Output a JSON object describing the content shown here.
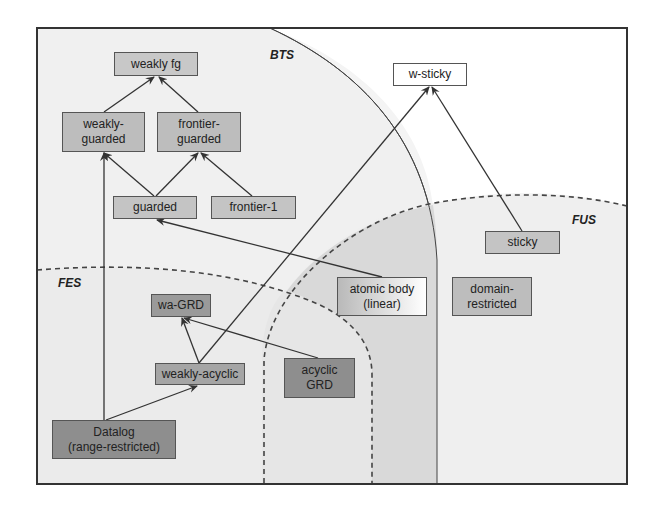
{
  "regions": {
    "bts": {
      "label": "BTS"
    },
    "fus": {
      "label": "FUS"
    },
    "fes": {
      "label": "FES"
    }
  },
  "nodes": [
    {
      "id": "weakly-fg",
      "label": "weakly fg",
      "x": 114,
      "y": 52,
      "w": 84,
      "h": 24,
      "fill": "#c8c8c8"
    },
    {
      "id": "weakly-guarded",
      "label": "weakly-\nguarded",
      "x": 62,
      "y": 112,
      "w": 83,
      "h": 40,
      "fill": "#bdbdbd"
    },
    {
      "id": "frontier-guarded",
      "label": "frontier-\nguarded",
      "x": 157,
      "y": 112,
      "w": 84,
      "h": 40,
      "fill": "#bdbdbd"
    },
    {
      "id": "guarded",
      "label": "guarded",
      "x": 113,
      "y": 196,
      "w": 84,
      "h": 23,
      "fill": "#c4c4c4"
    },
    {
      "id": "frontier-1",
      "label": "frontier-1",
      "x": 211,
      "y": 196,
      "w": 85,
      "h": 23,
      "fill": "#c4c4c4"
    },
    {
      "id": "w-sticky",
      "label": "w-sticky",
      "x": 393,
      "y": 63,
      "w": 74,
      "h": 23,
      "fill": "#ffffff"
    },
    {
      "id": "sticky",
      "label": "sticky",
      "x": 485,
      "y": 231,
      "w": 75,
      "h": 23,
      "fill": "#c4c4c4"
    },
    {
      "id": "atomic-body",
      "label": "atomic body\n(linear)",
      "x": 337,
      "y": 277,
      "w": 90,
      "h": 39,
      "fill": "gradient-white"
    },
    {
      "id": "domain-restricted",
      "label": "domain-\nrestricted",
      "x": 452,
      "y": 277,
      "w": 80,
      "h": 39,
      "fill": "#bdbdbd"
    },
    {
      "id": "wa-grd",
      "label": "wa-GRD",
      "x": 151,
      "y": 294,
      "w": 60,
      "h": 23,
      "fill": "#9a9a9a"
    },
    {
      "id": "weakly-acyclic",
      "label": "weakly-acyclic",
      "x": 155,
      "y": 363,
      "w": 90,
      "h": 22,
      "fill": "#a5a5a5"
    },
    {
      "id": "acyclic-grd",
      "label": "acyclic\nGRD",
      "x": 284,
      "y": 358,
      "w": 71,
      "h": 40,
      "fill": "#8e8e8e"
    },
    {
      "id": "datalog",
      "label": "Datalog\n(range-restricted)",
      "x": 52,
      "y": 420,
      "w": 124,
      "h": 39,
      "fill": "#8e8e8e"
    }
  ],
  "edges": [
    {
      "from": "weakly-guarded",
      "to": "weakly-fg",
      "x1": 104,
      "y1": 112,
      "x2": 154,
      "y2": 77
    },
    {
      "from": "frontier-guarded",
      "to": "weakly-fg",
      "x1": 198,
      "y1": 112,
      "x2": 159,
      "y2": 77
    },
    {
      "from": "guarded",
      "to": "weakly-guarded",
      "x1": 154,
      "y1": 196,
      "x2": 104,
      "y2": 153
    },
    {
      "from": "guarded",
      "to": "frontier-guarded",
      "x1": 156,
      "y1": 196,
      "x2": 198,
      "y2": 153
    },
    {
      "from": "frontier-1",
      "to": "frontier-guarded",
      "x1": 252,
      "y1": 196,
      "x2": 201,
      "y2": 153
    },
    {
      "from": "atomic-body",
      "to": "guarded",
      "x1": 382,
      "y1": 277,
      "x2": 157,
      "y2": 220
    },
    {
      "from": "weakly-acyclic",
      "to": "w-sticky",
      "x1": 199,
      "y1": 363,
      "x2": 429,
      "y2": 87
    },
    {
      "from": "sticky",
      "to": "w-sticky",
      "x1": 522,
      "y1": 231,
      "x2": 432,
      "y2": 87
    },
    {
      "from": "datalog",
      "to": "weakly-guarded",
      "x1": 104,
      "y1": 420,
      "x2": 104,
      "y2": 153
    },
    {
      "from": "datalog",
      "to": "weakly-acyclic",
      "x1": 106,
      "y1": 420,
      "x2": 197,
      "y2": 386
    },
    {
      "from": "weakly-acyclic",
      "to": "wa-grd",
      "x1": 199,
      "y1": 363,
      "x2": 182,
      "y2": 318
    },
    {
      "from": "acyclic-grd",
      "to": "wa-grd",
      "x1": 318,
      "y1": 358,
      "x2": 184,
      "y2": 318
    }
  ],
  "colors": {
    "frame": "#333333",
    "edge": "#333333",
    "bts_fill": "#f1f1f1",
    "fus_fill": "#efefef",
    "fes_fill": "#ededed",
    "overlap_fill": "#dcdcdc"
  }
}
